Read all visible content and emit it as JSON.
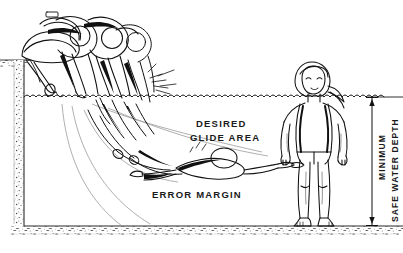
{
  "figure": {
    "type": "technical-line-illustration",
    "width": 403,
    "height": 253,
    "background_color": "#ffffff",
    "ink_color": "#111111",
    "trajectory_color": "#9a9a9a",
    "stipple_color": "#5a5a5a"
  },
  "labels": {
    "desired": "DESIRED",
    "glide_area": "GLIDE  AREA",
    "error_margin": "ERROR  MARGIN",
    "minimum": "MINIMUM",
    "safe_water_depth": "SAFE WATER DEPTH"
  },
  "scene": {
    "waterline_label": "water-surface",
    "pool_wall_label": "pool-wall",
    "pool_floor_label": "pool-floor",
    "deck_label": "pool-deck",
    "diver_sequence_label": "diver-motion-sequence",
    "glide_swimmer_label": "gliding-swimmer",
    "standing_swimmer_label": "standing-swimmer",
    "dimension_line_label": "depth-dimension-line"
  },
  "geometry": {
    "waterline_y": 97,
    "floor_y": 226,
    "wall_x": 20,
    "deck_y": 60,
    "dimension_x": 372,
    "dimension_top_y": 97,
    "dimension_bottom_y": 226
  }
}
